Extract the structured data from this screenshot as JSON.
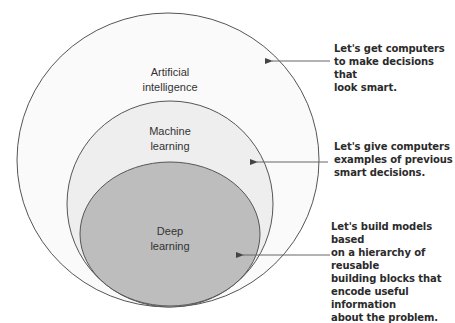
{
  "diagram": {
    "type": "nested-venn",
    "colors": {
      "background": "#ffffff",
      "outer_fill": "#fafafa",
      "middle_fill": "#eeeeee",
      "inner_fill": "#bdbdbd",
      "stroke": "#555555",
      "arrow": "#666666",
      "text": "#2b2b2b"
    },
    "regions": [
      {
        "id": "ai",
        "label": "Artificial\nintelligence",
        "annotation": "Let's get computers\nto make decisions that\nlook smart."
      },
      {
        "id": "ml",
        "label": "Machine\nlearning",
        "annotation": "Let's give computers\nexamples of previous\nsmart decisions."
      },
      {
        "id": "dl",
        "label": "Deep\nlearning",
        "annotation": "Let's build models based\non a hierarchy of reusable\nbuilding blocks that\nencode useful information\nabout the problem."
      }
    ]
  }
}
